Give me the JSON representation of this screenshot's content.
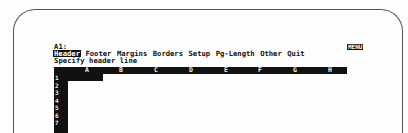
{
  "control_panel": {
    "cell_address": "A1:",
    "mode_indicator": "MENU",
    "menu_items": [
      {
        "label": "Header",
        "active": true
      },
      {
        "label": "Footer",
        "active": false
      },
      {
        "label": "Margins",
        "active": false
      },
      {
        "label": "Borders",
        "active": false
      },
      {
        "label": "Setup",
        "active": false
      },
      {
        "label": "Pg-Length",
        "active": false
      },
      {
        "label": "Other",
        "active": false
      },
      {
        "label": "Quit",
        "active": false
      }
    ],
    "prompt": "Specify header line"
  },
  "worksheet": {
    "columns": [
      "A",
      "B",
      "C",
      "D",
      "E",
      "F",
      "G",
      "H"
    ],
    "rows": [
      "1",
      "2",
      "3",
      "4",
      "5",
      "6",
      "7"
    ],
    "current_cell": "A1"
  },
  "colors": {
    "screen_bg": "#fdfdfd",
    "ink": "#111111",
    "bezel": "#555555"
  }
}
